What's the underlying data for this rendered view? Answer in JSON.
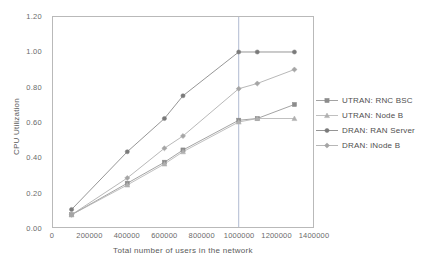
{
  "chart_data": {
    "type": "line",
    "title": "",
    "xlabel": "Total number of users in the network",
    "ylabel": "CPU Utilization",
    "xlim": [
      0,
      1400000
    ],
    "ylim": [
      0,
      1.2
    ],
    "xticks": [
      0,
      200000,
      400000,
      600000,
      800000,
      1000000,
      1200000,
      1400000
    ],
    "xtick_labels": [
      "0",
      "200000",
      "400000",
      "600000",
      "800000",
      "1000000",
      "1200000",
      "1400000"
    ],
    "yticks": [
      0.0,
      0.2,
      0.4,
      0.6,
      0.8,
      1.0,
      1.2
    ],
    "ytick_labels": [
      "0.00",
      "0.20",
      "0.40",
      "0.60",
      "0.80",
      "1.00",
      "1.20"
    ],
    "grid": false,
    "legend_position": "right",
    "reference_line": {
      "axis": "x",
      "value": 1000000
    },
    "x": [
      100000,
      400000,
      600000,
      700000,
      1000000,
      1100000,
      1300000
    ],
    "series": [
      {
        "name": "UTRAN: RNC BSC",
        "marker": "square",
        "color": "#8c8c8c",
        "values": [
          0.07,
          0.25,
          0.37,
          0.44,
          0.61,
          0.62,
          0.7
        ]
      },
      {
        "name": "UTRAN: Node B",
        "marker": "triangle",
        "color": "#b0b0b0",
        "values": [
          0.07,
          0.24,
          0.36,
          0.43,
          0.6,
          0.62,
          0.62
        ]
      },
      {
        "name": "DRAN: RAN Server",
        "marker": "circle",
        "color": "#7a7a7a",
        "values": [
          0.1,
          0.43,
          0.62,
          0.75,
          1.0,
          1.0,
          1.0
        ]
      },
      {
        "name": "DRAN: iNode B",
        "marker": "diamond",
        "color": "#a5a5a5",
        "values": [
          0.07,
          0.28,
          0.45,
          0.52,
          0.79,
          0.82,
          0.9
        ]
      }
    ]
  },
  "legend": {
    "items": [
      {
        "label": "UTRAN: RNC BSC"
      },
      {
        "label": "UTRAN: Node B"
      },
      {
        "label": "DRAN: RAN Server"
      },
      {
        "label": "DRAN: iNode B"
      }
    ]
  }
}
